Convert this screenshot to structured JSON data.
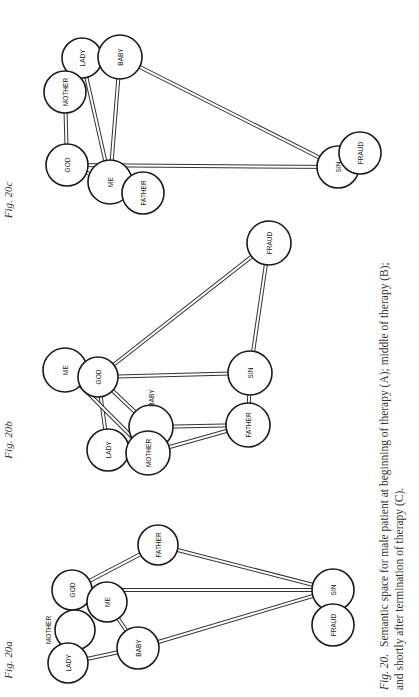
{
  "rotation": -90,
  "figures": [
    {
      "id": "a",
      "label": "Fig. 20a",
      "label_pos": [
        12,
        660
      ],
      "nodes": [
        {
          "name": "GOD",
          "x": 72,
          "y": 590,
          "r": 20
        },
        {
          "name": "ME",
          "x": 107,
          "y": 602,
          "r": 20
        },
        {
          "name": "MOTHER",
          "x": 75,
          "y": 630,
          "r": 20,
          "label_outside": [
            48,
            630
          ]
        },
        {
          "name": "LADY",
          "x": 68,
          "y": 663,
          "r": 20
        },
        {
          "name": "BABY",
          "x": 138,
          "y": 648,
          "r": 21
        },
        {
          "name": "FATHER",
          "x": 158,
          "y": 545,
          "r": 20
        },
        {
          "name": "SIN",
          "x": 333,
          "y": 590,
          "r": 21
        },
        {
          "name": "FRAUD",
          "x": 333,
          "y": 625,
          "r": 21
        }
      ],
      "edges": [
        [
          "GOD",
          "MOTHER"
        ],
        [
          "GOD",
          "FATHER"
        ],
        [
          "GOD",
          "SIN"
        ],
        [
          "MOTHER",
          "LADY"
        ],
        [
          "LADY",
          "BABY"
        ],
        [
          "ME",
          "BABY"
        ],
        [
          "FATHER",
          "SIN"
        ],
        [
          "BABY",
          "SIN"
        ]
      ]
    },
    {
      "id": "b",
      "label": "Fig. 20b",
      "label_pos": [
        12,
        440
      ],
      "nodes": [
        {
          "name": "ME",
          "x": 65,
          "y": 370,
          "r": 22
        },
        {
          "name": "GOD",
          "x": 98,
          "y": 377,
          "r": 20
        },
        {
          "name": "SIN",
          "x": 250,
          "y": 373,
          "r": 22
        },
        {
          "name": "FATHER",
          "x": 248,
          "y": 425,
          "r": 22
        },
        {
          "name": "BABY",
          "x": 151,
          "y": 427,
          "r": 22,
          "label_outside": [
            151,
            398
          ]
        },
        {
          "name": "LADY",
          "x": 108,
          "y": 450,
          "r": 21
        },
        {
          "name": "MOTHER",
          "x": 148,
          "y": 453,
          "r": 22
        },
        {
          "name": "FRAUD",
          "x": 269,
          "y": 243,
          "r": 22
        }
      ],
      "edges": [
        [
          "GOD",
          "SIN"
        ],
        [
          "GOD",
          "FRAUD"
        ],
        [
          "SIN",
          "FRAUD"
        ],
        [
          "SIN",
          "FATHER"
        ],
        [
          "GOD",
          "BABY"
        ],
        [
          "GOD",
          "LADY"
        ],
        [
          "ME",
          "MOTHER"
        ],
        [
          "BABY",
          "FATHER"
        ],
        [
          "MOTHER",
          "FATHER"
        ]
      ]
    },
    {
      "id": "c",
      "label": "Fig. 20c",
      "label_pos": [
        12,
        200
      ],
      "nodes": [
        {
          "name": "LADY",
          "x": 82,
          "y": 58,
          "r": 20
        },
        {
          "name": "BABY",
          "x": 120,
          "y": 57,
          "r": 22
        },
        {
          "name": "MOTHER",
          "x": 65,
          "y": 92,
          "r": 21
        },
        {
          "name": "GOD",
          "x": 67,
          "y": 165,
          "r": 21
        },
        {
          "name": "ME",
          "x": 110,
          "y": 182,
          "r": 22
        },
        {
          "name": "FATHER",
          "x": 143,
          "y": 193,
          "r": 21
        },
        {
          "name": "SIN",
          "x": 338,
          "y": 167,
          "r": 21
        },
        {
          "name": "FRAUD",
          "x": 360,
          "y": 153,
          "r": 21
        }
      ],
      "edges": [
        [
          "MOTHER",
          "GOD"
        ],
        [
          "LADY",
          "ME"
        ],
        [
          "BABY",
          "ME"
        ],
        [
          "BABY",
          "SIN"
        ],
        [
          "GOD",
          "SIN"
        ],
        [
          "GOD",
          "ME"
        ]
      ]
    }
  ],
  "caption": {
    "fig_ref": "Fig. 20.",
    "line1": "Semantic space for male patient at beginning of therapy (A); middle of therapy (B);",
    "line2": "and shortly after termination of therapy (C)."
  }
}
